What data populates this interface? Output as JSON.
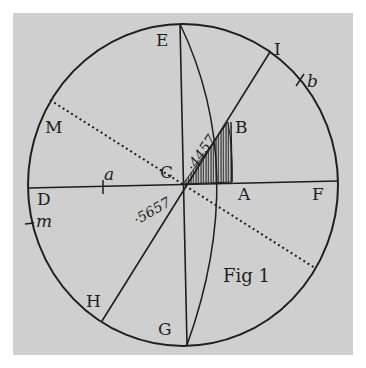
{
  "figure": {
    "caption": "Fig 1",
    "colors": {
      "paper": "#cfcfcf",
      "ink": "#1e1e1e",
      "background": "#ffffff"
    },
    "points": {
      "E": "E",
      "I": "I",
      "b": "b",
      "M": "M",
      "B": "B",
      "C": "C",
      "a": "a",
      "D": "D",
      "m": "m",
      "A": "A",
      "F": "F",
      "H": "H",
      "G": "G"
    },
    "numbers": {
      "upper": "·4457",
      "lower": "·5657"
    }
  }
}
